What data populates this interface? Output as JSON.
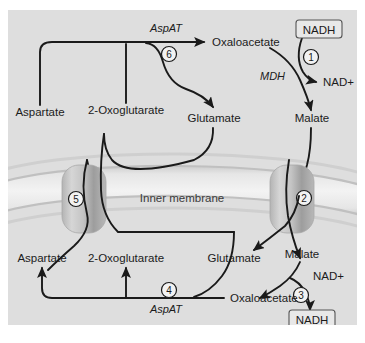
{
  "figure": {
    "background_color": "#dedede",
    "membrane_label": "Inner membrane"
  },
  "upper_compartment": {
    "metabolites": [
      {
        "name": "oxaloacetate-upper",
        "label": "Oxaloacetate"
      },
      {
        "name": "malate-upper",
        "label": "Malate"
      },
      {
        "name": "aspartate-upper",
        "label": "Aspartate"
      },
      {
        "name": "2-oxoglutarate-upper",
        "label": "2-Oxoglutarate"
      },
      {
        "name": "glutamate-upper",
        "label": "Glutamate"
      }
    ],
    "enzymes": [
      {
        "name": "aspat-upper",
        "label": "AspAT"
      },
      {
        "name": "mdh-upper",
        "label": "MDH"
      }
    ],
    "cofactors": [
      {
        "name": "nadh-upper",
        "label": "NADH",
        "boxed": true
      },
      {
        "name": "nad-plus-upper",
        "label": "NAD+",
        "boxed": false
      }
    ],
    "steps": [
      {
        "name": "step-1",
        "label": "1"
      },
      {
        "name": "step-6",
        "label": "6"
      }
    ]
  },
  "lower_compartment": {
    "metabolites": [
      {
        "name": "aspartate-lower",
        "label": "Aspartate"
      },
      {
        "name": "2-oxoglutarate-lower",
        "label": "2-Oxoglutarate"
      },
      {
        "name": "glutamate-lower",
        "label": "Glutamate"
      },
      {
        "name": "malate-lower",
        "label": "Malate"
      },
      {
        "name": "oxaloacetate-lower",
        "label": "Oxaloacetate"
      }
    ],
    "enzymes": [
      {
        "name": "aspat-lower",
        "label": "AspAT"
      }
    ],
    "cofactors": [
      {
        "name": "nad-plus-lower",
        "label": "NAD+",
        "boxed": false
      },
      {
        "name": "nadh-lower",
        "label": "NADH",
        "boxed": true
      }
    ],
    "steps": [
      {
        "name": "step-3",
        "label": "3"
      },
      {
        "name": "step-4",
        "label": "4"
      }
    ]
  },
  "transporters": [
    {
      "name": "transporter-left",
      "label": "5"
    },
    {
      "name": "transporter-right",
      "label": "2"
    }
  ],
  "colors": {
    "panel_background": "#dedede",
    "membrane_band": "#efefef",
    "membrane_edge": "#c2c2c2",
    "transporter_light": "#d4d4d4",
    "transporter_dark": "#9a9a9a",
    "arrow_stroke": "#1a1a1a",
    "text": "#1b1b1b"
  }
}
